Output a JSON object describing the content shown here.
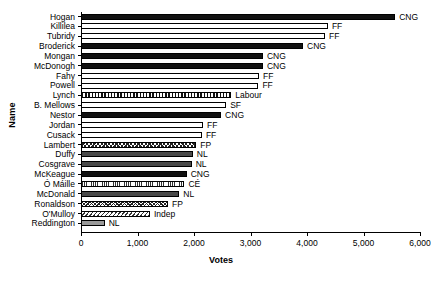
{
  "chart_data": {
    "type": "bar",
    "orientation": "horizontal",
    "title": "",
    "xlabel": "Votes",
    "ylabel": "Name",
    "xlim": [
      0,
      6000
    ],
    "xticks": [
      0,
      1000,
      2000,
      3000,
      4000,
      5000,
      6000
    ],
    "xticklabels": [
      "0",
      "1,000",
      "2,000",
      "3,000",
      "4,000",
      "5,000",
      "6,000"
    ],
    "grid": false,
    "legend": "none (party code annotated at end of each bar)",
    "categories": [
      "Hogan",
      "Killilea",
      "Tubridy",
      "Broderick",
      "Mongan",
      "McDonogh",
      "Fahy",
      "Powell",
      "Lynch",
      "B. Mellows",
      "Nestor",
      "Jordan",
      "Cusack",
      "Lambert",
      "Duffy",
      "Cosgrave",
      "McKeague",
      "Ó Máille",
      "McDonald",
      "Ronaldson",
      "O'Mulloy",
      "Reddington"
    ],
    "values": [
      5560,
      4370,
      4320,
      3930,
      3220,
      3220,
      3150,
      3140,
      2660,
      2570,
      2480,
      2160,
      2140,
      2040,
      1980,
      1960,
      1870,
      1830,
      1740,
      1540,
      1220,
      420
    ],
    "annotations": [
      "CNG",
      "FF",
      "FF",
      "CNG",
      "CNG",
      "CNG",
      "FF",
      "FF",
      "Labour",
      "SF",
      "CNG",
      "FF",
      "FF",
      "FP",
      "NL",
      "NL",
      "CNG",
      "CÉ",
      "NL",
      "FP",
      "Indep",
      "NL"
    ],
    "bars": [
      {
        "name": "Hogan",
        "value": 5560,
        "party": "CNG",
        "fill": "f-black"
      },
      {
        "name": "Killilea",
        "value": 4370,
        "party": "FF",
        "fill": "f-white"
      },
      {
        "name": "Tubridy",
        "value": 4320,
        "party": "FF",
        "fill": "f-white"
      },
      {
        "name": "Broderick",
        "value": 3930,
        "party": "CNG",
        "fill": "f-black"
      },
      {
        "name": "Mongan",
        "value": 3220,
        "party": "CNG",
        "fill": "f-black"
      },
      {
        "name": "McDonogh",
        "value": 3220,
        "party": "CNG",
        "fill": "f-black"
      },
      {
        "name": "Fahy",
        "value": 3150,
        "party": "FF",
        "fill": "f-white"
      },
      {
        "name": "Powell",
        "value": 3140,
        "party": "FF",
        "fill": "f-white"
      },
      {
        "name": "Lynch",
        "value": 2660,
        "party": "Labour",
        "fill": "f-grid"
      },
      {
        "name": "B. Mellows",
        "value": 2570,
        "party": "SF",
        "fill": "f-white"
      },
      {
        "name": "Nestor",
        "value": 2480,
        "party": "CNG",
        "fill": "f-black"
      },
      {
        "name": "Jordan",
        "value": 2160,
        "party": "FF",
        "fill": "f-white"
      },
      {
        "name": "Cusack",
        "value": 2140,
        "party": "FF",
        "fill": "f-white"
      },
      {
        "name": "Lambert",
        "value": 2040,
        "party": "FP",
        "fill": "f-cross"
      },
      {
        "name": "Duffy",
        "value": 1980,
        "party": "NL",
        "fill": "f-dark"
      },
      {
        "name": "Cosgrave",
        "value": 1960,
        "party": "NL",
        "fill": "f-dark"
      },
      {
        "name": "McKeague",
        "value": 1870,
        "party": "CNG",
        "fill": "f-black"
      },
      {
        "name": "Ó Máille",
        "value": 1830,
        "party": "CÉ",
        "fill": "f-vfine"
      },
      {
        "name": "McDonald",
        "value": 1740,
        "party": "NL",
        "fill": "f-dark"
      },
      {
        "name": "Ronaldson",
        "value": 1540,
        "party": "FP",
        "fill": "f-cross"
      },
      {
        "name": "O'Mulloy",
        "value": 1220,
        "party": "Indep",
        "fill": "f-diag"
      },
      {
        "name": "Reddington",
        "value": 420,
        "party": "NL",
        "fill": "f-lgray"
      }
    ]
  },
  "axis": {
    "x_title": "Votes",
    "y_title": "Name"
  }
}
